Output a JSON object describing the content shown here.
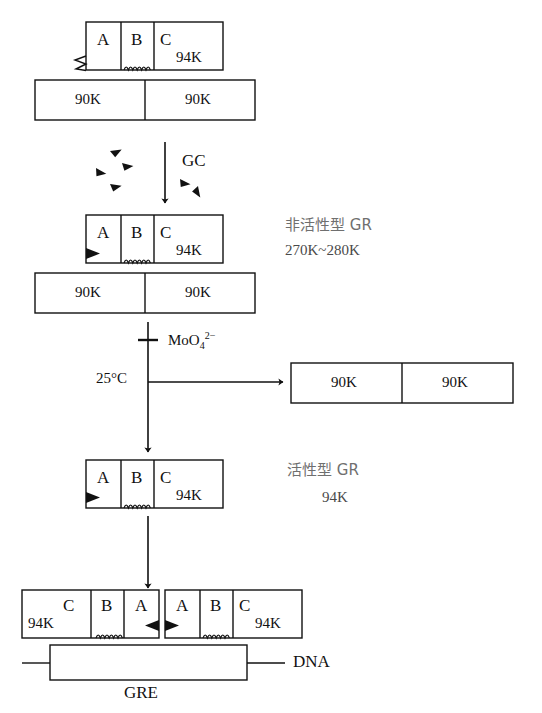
{
  "figure": {
    "domain_colors": {
      "ink": "#111111",
      "chinese_text": "#6f6f6f",
      "background": "#ffffff"
    }
  },
  "stage1": {
    "name": "inactive-receptor-complex-unbound",
    "subunits": [
      {
        "id": "A",
        "label": "A"
      },
      {
        "id": "B",
        "label": "B"
      },
      {
        "id": "C",
        "label": "C",
        "mass": "94K"
      }
    ],
    "chaperones": [
      {
        "label": "90K"
      },
      {
        "label": "90K"
      }
    ],
    "binding_site_icon": "zigzag-open-site-icon",
    "hinge_icon": "coil-hinge-icon"
  },
  "step1": {
    "arrow_name": "gc-binding-arrow",
    "ligand_label": "GC",
    "ligand_icon": "triangle-ligand-icon",
    "ligand_count": 6
  },
  "stage2": {
    "name": "inactive-gr-with-ligand",
    "subunits": [
      {
        "id": "A",
        "label": "A"
      },
      {
        "id": "B",
        "label": "B"
      },
      {
        "id": "C",
        "label": "C",
        "mass": "94K"
      }
    ],
    "chaperones": [
      {
        "label": "90K"
      },
      {
        "label": "90K"
      }
    ],
    "bound_ligand_icon": "filled-triangle-bound-icon",
    "hinge_icon": "coil-hinge-icon",
    "annotation": {
      "line1": "非活性型 GR",
      "line2": "270K~280K"
    }
  },
  "step2": {
    "arrow_name": "transformation-arrow",
    "inhibitor_label": "MoO",
    "inhibitor_sub": "4",
    "inhibitor_sup": "2−",
    "inhibitor_marker": "inhibition-cross-icon",
    "temperature_label": "25°C",
    "branch_arrow_name": "chaperone-release-arrow"
  },
  "released": {
    "name": "released-chaperone-dimer",
    "chaperones": [
      {
        "label": "90K"
      },
      {
        "label": "90K"
      }
    ]
  },
  "stage3": {
    "name": "active-gr-monomer",
    "subunits": [
      {
        "id": "A",
        "label": "A"
      },
      {
        "id": "B",
        "label": "B"
      },
      {
        "id": "C",
        "label": "C",
        "mass": "94K"
      }
    ],
    "bound_ligand_icon": "filled-triangle-bound-icon",
    "hinge_icon": "coil-hinge-icon",
    "annotation": {
      "line1": "活性型 GR",
      "line2": "94K"
    }
  },
  "step3": {
    "arrow_name": "dimerization-dna-binding-arrow"
  },
  "stage4": {
    "name": "gr-homodimer-on-dna",
    "left_monomer": {
      "subunits": [
        {
          "id": "C",
          "label": "C",
          "mass": "94K"
        },
        {
          "id": "B",
          "label": "B"
        },
        {
          "id": "A",
          "label": "A"
        }
      ]
    },
    "right_monomer": {
      "subunits": [
        {
          "id": "A",
          "label": "A"
        },
        {
          "id": "B",
          "label": "B"
        },
        {
          "id": "C",
          "label": "C",
          "mass": "94K"
        }
      ]
    },
    "dna_label": "DNA",
    "response_element_label": "GRE"
  }
}
